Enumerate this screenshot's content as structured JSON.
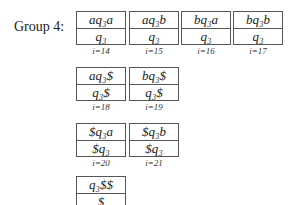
{
  "group_label": "Group 4:",
  "cells": [
    {
      "top": "aq₃a",
      "bottom": "q₃",
      "index": "i=14",
      "x": 76,
      "y": 11
    },
    {
      "top": "aq₃b",
      "bottom": "q₃",
      "index": "i=15",
      "x": 129,
      "y": 11
    },
    {
      "top": "bq₃a",
      "bottom": "q₃",
      "index": "i=16",
      "x": 181,
      "y": 11
    },
    {
      "top": "bq₃b",
      "bottom": "q₃",
      "index": "i=17",
      "x": 233,
      "y": 11
    },
    {
      "top": "aq₃$",
      "bottom": "q₃$",
      "index": "i=18",
      "x": 76,
      "y": 67
    },
    {
      "top": "bq₃$",
      "bottom": "q₃$",
      "index": "i=19",
      "x": 129,
      "y": 67
    },
    {
      "top": "$q₃a",
      "bottom": "$q₃",
      "index": "i=20",
      "x": 76,
      "y": 123
    },
    {
      "top": "$q₃b",
      "bottom": "$q₃",
      "index": "i=21",
      "x": 129,
      "y": 123
    },
    {
      "top": "q₃$$",
      "bottom": "$",
      "index": "i=22",
      "x": 76,
      "y": 179
    }
  ]
}
